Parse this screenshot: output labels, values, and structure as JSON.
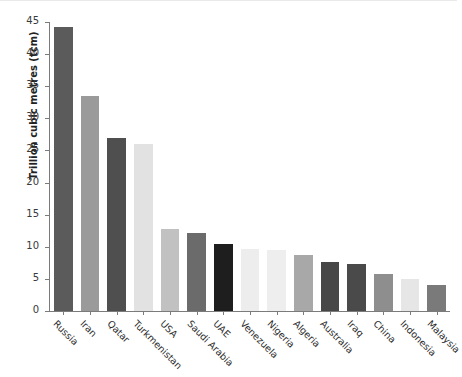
{
  "chart_data": {
    "type": "bar",
    "title": "",
    "xlabel": "",
    "ylabel": "Trillion cubic metres (tcm)",
    "ylim": [
      0,
      45
    ],
    "yticks": [
      0,
      5,
      10,
      15,
      20,
      25,
      30,
      35,
      40,
      45
    ],
    "ytick_labels": [
      "0",
      "5",
      "10",
      "15",
      "20",
      "25",
      "30",
      "35",
      "40",
      "45"
    ],
    "grid": false,
    "legend": "none",
    "categories": [
      "Russia",
      "Iran",
      "Qatar",
      "Turkmenistan",
      "USA",
      "Saudi Arabia",
      "UAE",
      "Venezuela",
      "Nigeria",
      "Algeria",
      "Australia",
      "Iraq",
      "China",
      "Indonesia",
      "Malaysia"
    ],
    "values": [
      44.2,
      33.5,
      27.0,
      26.0,
      12.7,
      12.2,
      10.4,
      9.7,
      9.5,
      8.8,
      7.6,
      7.3,
      5.7,
      5.0,
      4.0
    ],
    "bar_colors": [
      "#5b5b5b",
      "#9a9a9a",
      "#4f4f4f",
      "#e2e2e2",
      "#c1c1c1",
      "#6b6b6b",
      "#1e1e1e",
      "#ededed",
      "#eeeeee",
      "#a8a8a8",
      "#474747",
      "#4a4a4a",
      "#8e8e8e",
      "#e6e6e6",
      "#7a7a7a"
    ]
  },
  "axis": {
    "tick_color": "#7b7b7b",
    "label_color": "#3a3a3a"
  }
}
